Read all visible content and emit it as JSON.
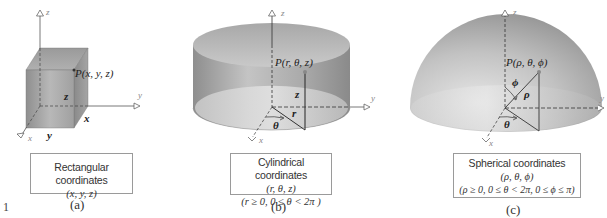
{
  "figure_number": "1",
  "panels": [
    {
      "id": "a",
      "sub_label": "(a)",
      "caption_title": "Rectangular coordinates",
      "caption_lines": [
        "(x, y, z)"
      ],
      "point_label": "P(x, y, z)",
      "axes": {
        "x": "x",
        "y": "y",
        "z": "z"
      },
      "dimension_labels": {
        "x": "x",
        "y": "y",
        "z": "z"
      },
      "solid": "rectangular box"
    },
    {
      "id": "b",
      "sub_label": "(b)",
      "caption_title": "Cylindrical coordinates",
      "caption_lines": [
        "(r, θ, z)",
        "(r ≥ 0, 0 ≤ θ < 2π )"
      ],
      "point_label": "P(r, θ, z)",
      "axes": {
        "x": "x",
        "y": "y",
        "z": "z"
      },
      "dimension_labels": {
        "r": "r",
        "theta": "θ",
        "z": "z"
      },
      "solid": "cylinder"
    },
    {
      "id": "c",
      "sub_label": "(c)",
      "caption_title": "Spherical coordinates",
      "caption_lines": [
        "(ρ, θ, ϕ)",
        "(ρ ≥ 0, 0 ≤ θ < 2π, 0 ≤ ϕ ≤ π)"
      ],
      "point_label": "P(ρ, θ, ϕ)",
      "axes": {
        "x": "x",
        "y": "y",
        "z": "z"
      },
      "dimension_labels": {
        "rho": "ρ",
        "theta": "θ",
        "phi": "ϕ"
      },
      "solid": "hemisphere"
    }
  ],
  "colors": {
    "solid_dark": "#8c8c8c",
    "solid_mid": "#b3b3b3",
    "solid_light": "#dcdcdc",
    "axis": "#555555",
    "caption_border": "#9a9a9a"
  }
}
